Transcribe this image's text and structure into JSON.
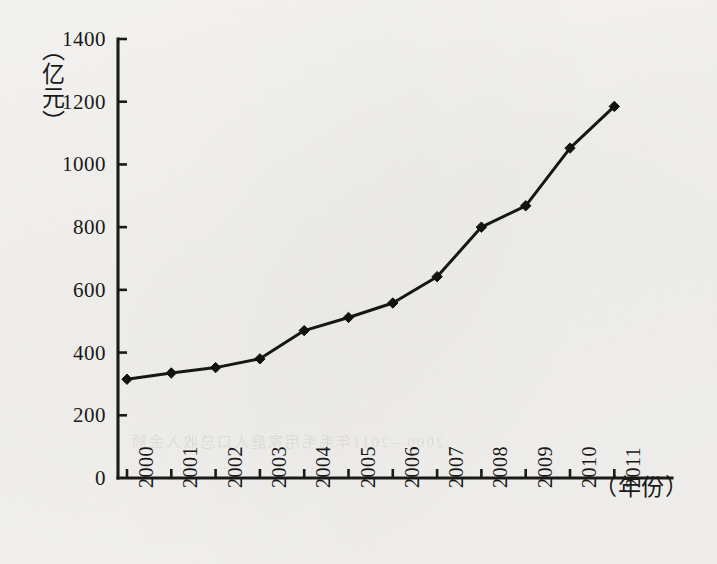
{
  "chart_data": {
    "type": "line",
    "title": "",
    "subtitle": "",
    "xlabel": "（年份）",
    "ylabel": "（亿元）",
    "categories": [
      "2000",
      "2001",
      "2002",
      "2003",
      "2004",
      "2005",
      "2006",
      "2007",
      "2008",
      "2009",
      "2010",
      "2011"
    ],
    "values": [
      315,
      335,
      352,
      380,
      470,
      512,
      558,
      642,
      800,
      868,
      1052,
      1185
    ],
    "series": [
      {
        "name": "",
        "values": [
          315,
          335,
          352,
          380,
          470,
          512,
          558,
          642,
          800,
          868,
          1052,
          1185
        ]
      }
    ],
    "ylim": [
      0,
      1400
    ],
    "yticks": [
      0,
      200,
      400,
      600,
      800,
      1000,
      1200,
      1400
    ],
    "ytick_labels": [
      "0",
      "200",
      "400",
      "600",
      "800",
      "1000",
      "1200",
      "1400"
    ],
    "grid": false,
    "legend": null,
    "legend_position": "none",
    "marker": "diamond",
    "line_color": "#161615",
    "marker_color": "#121211",
    "axis_color": "#1a1a18"
  },
  "axis": {
    "y_label_chars": "（亿元）",
    "x_label": "（年份）"
  },
  "page": {
    "background_color": "#f4f3f1",
    "ink_color": "#191917",
    "ghost_text": "2000—2011年毛毛用家庭人口总收入金额"
  }
}
